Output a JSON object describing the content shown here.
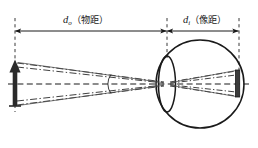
{
  "diagram": {
    "type": "optical-ray-diagram",
    "background_color": "#ffffff",
    "stroke_color": "#1a1a1a",
    "labels": {
      "object_distance": {
        "symbol": "d",
        "subscript": "o",
        "text_cn": "（物距）",
        "full": "dₒ（物距）",
        "meaning": "object distance"
      },
      "image_distance": {
        "symbol": "d",
        "subscript": "i",
        "text_cn": "（像距）",
        "full": "dᵢ（像距）",
        "meaning": "image distance"
      }
    },
    "elements": {
      "object_arrow": "upright-object-arrow",
      "eyeball": "eyeball-circle",
      "lens": "crystalline-lens-ellipse",
      "retina_image": "inverted-image-on-retina",
      "optical_axis": "optical-axis-dashed",
      "rays": "chief-and-marginal-rays",
      "angle_arc": "visual-angle-arc",
      "dimension_left": "object-distance-dimension-line",
      "dimension_right": "image-distance-dimension-line",
      "ref_line_object": "object-plane-reference-dashed",
      "ref_line_lens": "lens-plane-reference-dashed",
      "ref_line_retina": "retina-plane-reference-dashed"
    },
    "geometry": {
      "object_x": 15,
      "lens_x": 167,
      "retina_x": 239,
      "axis_y": 84,
      "eye_center_x": 200,
      "eye_center_y": 84,
      "eye_radius": 44,
      "object_top_y": 62,
      "object_bottom_y": 106
    }
  }
}
